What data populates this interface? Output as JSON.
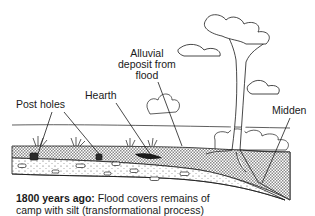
{
  "labels": {
    "alluvial": [
      "Alluvial",
      "deposit from",
      "flood"
    ],
    "hearth": "Hearth",
    "post_holes": "Post holes",
    "midden": "Midden"
  },
  "caption": {
    "bold": "1800 years ago:",
    "line1_rest": " Flood covers remains of",
    "line2": "camp with silt (transformational process)"
  },
  "colors": {
    "ink": "#1a1a1a",
    "background": "#ffffff",
    "hatch": "#9a9a9a"
  }
}
